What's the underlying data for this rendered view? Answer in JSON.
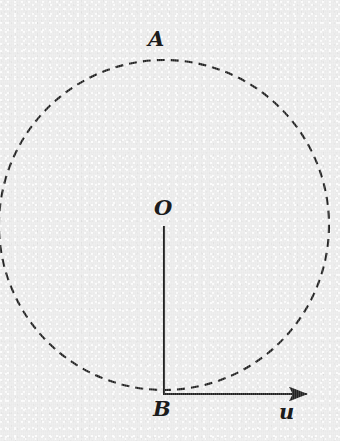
{
  "figure": {
    "background_color": "#ececec",
    "ink_color": "#232323",
    "labels": {
      "a": "A",
      "o": "O",
      "b": "B",
      "u": "u"
    }
  },
  "chart_data": {
    "type": "diagram",
    "title": "",
    "elements": [
      {
        "name": "circle",
        "shape": "circle",
        "style": "dashed",
        "center": [
          164,
          225
        ],
        "radius": 165,
        "stroke": "#232323",
        "stroke_width": 2,
        "dash_pattern": [
          8,
          6
        ]
      },
      {
        "name": "radius-segment-OB",
        "shape": "line",
        "style": "solid",
        "from": [
          164,
          226
        ],
        "to": [
          164,
          394
        ],
        "stroke": "#232323",
        "stroke_width": 2
      },
      {
        "name": "vector-u",
        "shape": "arrow",
        "style": "solid",
        "from": [
          164,
          394
        ],
        "to": [
          316,
          394
        ],
        "stroke": "#232323",
        "stroke_width": 2,
        "arrowhead": "filled-triangle"
      }
    ],
    "points": [
      {
        "label": "A",
        "position": [
          164,
          60
        ],
        "note": "top of circle"
      },
      {
        "label": "O",
        "position": [
          164,
          225
        ],
        "note": "center of circle"
      },
      {
        "label": "B",
        "position": [
          164,
          394
        ],
        "note": "bottom of circle, tail of vector u"
      }
    ],
    "annotations": [
      {
        "label": "u",
        "position": [
          288,
          412
        ],
        "note": "label of horizontal vector"
      }
    ],
    "xlabel": "",
    "ylabel": "",
    "grid": false,
    "legend": false
  }
}
